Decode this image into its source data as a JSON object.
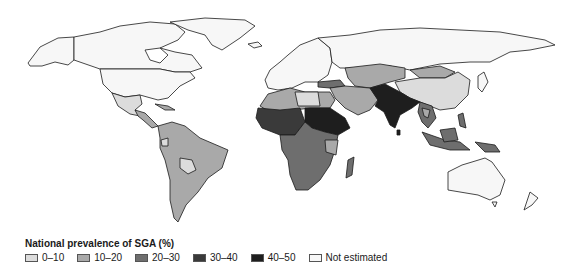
{
  "map": {
    "title": "National prevalence of SGA (%)",
    "projection": "world choropleth",
    "category_colors": {
      "0-10": "#dcdcdc",
      "10-20": "#a9a9a9",
      "20-30": "#6e6e6e",
      "30-40": "#3a3a3a",
      "40-50": "#1e1e1e",
      "not_estimated": "#f7f7f7"
    },
    "regions": [
      {
        "name": "North America (USA, Canada)",
        "category": "not_estimated"
      },
      {
        "name": "Greenland",
        "category": "not_estimated"
      },
      {
        "name": "Mexico",
        "category": "0-10"
      },
      {
        "name": "Central America & Caribbean",
        "category": "10-20"
      },
      {
        "name": "South America",
        "category": "10-20"
      },
      {
        "name": "Bolivia",
        "category": "0-10"
      },
      {
        "name": "Europe",
        "category": "not_estimated"
      },
      {
        "name": "Russia",
        "category": "not_estimated"
      },
      {
        "name": "Central Asia",
        "category": "10-20"
      },
      {
        "name": "Mongolia",
        "category": "10-20"
      },
      {
        "name": "China",
        "category": "0-10"
      },
      {
        "name": "Japan",
        "category": "not_estimated"
      },
      {
        "name": "Middle East",
        "category": "10-20"
      },
      {
        "name": "North Africa",
        "category": "10-20"
      },
      {
        "name": "West Africa / Sahel",
        "category": "30-40"
      },
      {
        "name": "Sudan / Horn of Africa",
        "category": "40-50"
      },
      {
        "name": "Central & Southern Africa",
        "category": "20-30"
      },
      {
        "name": "Madagascar",
        "category": "20-30"
      },
      {
        "name": "South Asia (India, Pakistan)",
        "category": "40-50"
      },
      {
        "name": "Southeast Asia",
        "category": "20-30"
      },
      {
        "name": "Australia",
        "category": "not_estimated"
      },
      {
        "name": "New Zealand",
        "category": "not_estimated"
      }
    ]
  },
  "legend": {
    "title": "National prevalence of SGA (%)",
    "items": [
      {
        "label": "0–10",
        "color": "#dcdcdc"
      },
      {
        "label": "10–20",
        "color": "#a9a9a9"
      },
      {
        "label": "20–30",
        "color": "#6e6e6e"
      },
      {
        "label": "30–40",
        "color": "#3a3a3a"
      },
      {
        "label": "40–50",
        "color": "#1e1e1e"
      },
      {
        "label": "Not estimated",
        "color": "#f7f7f7"
      }
    ]
  }
}
